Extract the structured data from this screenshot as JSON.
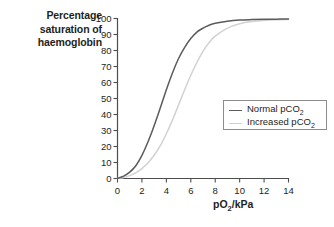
{
  "chart_data": {
    "type": "line",
    "title": "Percentage saturation of haemoglobin",
    "ylabel": "Percentage saturation of haemoglobin",
    "xlabel": "pO2/kPa",
    "xlabel_base": "pO",
    "xlabel_sub": "2",
    "xlabel_tail": "/kPa",
    "xlim": [
      0,
      14
    ],
    "ylim": [
      0,
      100
    ],
    "grid": false,
    "legend_position": "center-right",
    "xticks": [
      "0",
      "2",
      "4",
      "6",
      "8",
      "10",
      "12",
      "14"
    ],
    "xtick_values": [
      0,
      2,
      4,
      6,
      8,
      10,
      12,
      14
    ],
    "yticks": [
      "0",
      "10",
      "20",
      "30",
      "40",
      "50",
      "60",
      "70",
      "80",
      "90",
      "100"
    ],
    "ytick_values": [
      0,
      10,
      20,
      30,
      40,
      50,
      60,
      70,
      80,
      90,
      100
    ],
    "series": [
      {
        "name": "Normal pCO2",
        "name_base": "Normal pCO",
        "name_sub": "2",
        "color": "#5b5b5b",
        "x": [
          0,
          0.5,
          1,
          1.5,
          2,
          2.5,
          3,
          3.5,
          4,
          4.5,
          5,
          5.5,
          6,
          6.5,
          7,
          7.5,
          8,
          9,
          10,
          11,
          12,
          13,
          14
        ],
        "values": [
          0,
          1.5,
          4,
          8,
          14.5,
          23,
          33,
          44,
          55.5,
          66,
          75,
          82,
          87.5,
          91.5,
          94,
          95.8,
          97,
          98.3,
          99,
          99.3,
          99.5,
          99.6,
          99.7
        ]
      },
      {
        "name": "Increased pCO2",
        "name_base": "Increased pCO",
        "name_sub": "2",
        "color": "#d2d2d2",
        "x": [
          0,
          0.5,
          1,
          1.5,
          2,
          2.5,
          3,
          3.5,
          4,
          4.5,
          5,
          5.5,
          6,
          6.5,
          7,
          7.5,
          8,
          9,
          10,
          11,
          12,
          13,
          14
        ],
        "values": [
          0,
          0.6,
          1.8,
          3.6,
          6.2,
          9.8,
          14.5,
          20.5,
          28,
          36.5,
          46,
          55.5,
          64.5,
          72.5,
          79.5,
          85,
          89,
          94,
          96.7,
          98.1,
          98.8,
          99.2,
          99.4
        ]
      }
    ]
  },
  "axis_style": {
    "axis_color": "#4d4d4d",
    "tick_color": "#4d4d4d",
    "legend_border": "#8c8c8c",
    "text_color": "#231f20",
    "background": "#ffffff"
  }
}
